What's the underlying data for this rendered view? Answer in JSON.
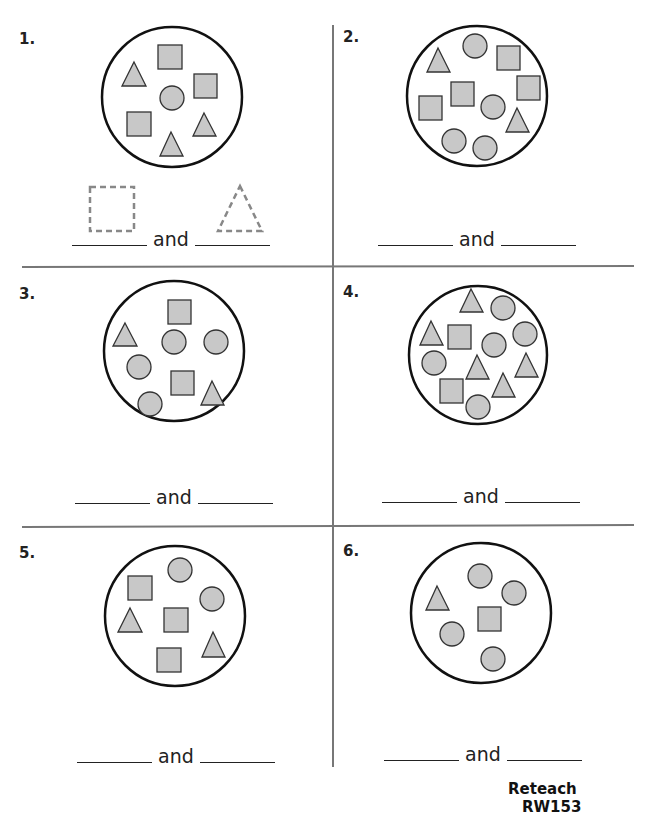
{
  "header_fragment": "",
  "problems": [
    {
      "number": "1.",
      "connector": "and",
      "hint_shapes": [
        "square",
        "triangle"
      ]
    },
    {
      "number": "2.",
      "connector": "and"
    },
    {
      "number": "3.",
      "connector": "and"
    },
    {
      "number": "4.",
      "connector": "and"
    },
    {
      "number": "5.",
      "connector": "and"
    },
    {
      "number": "6.",
      "connector": "and"
    }
  ],
  "footer": {
    "label": "Reteach",
    "code": "RW153"
  },
  "colors": {
    "fill": "#c8c8c8",
    "stroke": "#333333",
    "divider": "#777777",
    "dashed": "#888888"
  }
}
